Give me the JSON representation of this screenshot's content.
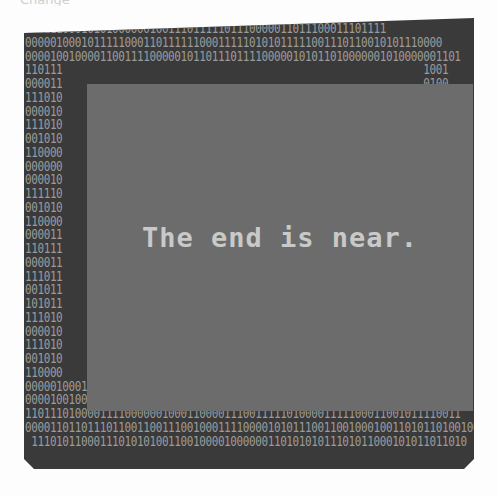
{
  "image": {
    "caption_fragment": "Change",
    "headline": "The end is near.",
    "colors": {
      "frame": "#3a3a3a",
      "panel": "#6c6c6c",
      "binary_text": "#9a9a9a",
      "headline_text": "#c9c9c9",
      "background": "#fdfdfd"
    },
    "binary_rows": [
      "1111110001010100000010011101111101110000011011100011101111",
      "0000010001011111000110111111000111110101011111001110110010101110000",
      "0000100100001100111100000101101110111100000101011010000001010000001101",
      "110111                                                          1001",
      "000011                                                          0100",
      "111010                                                          1010",
      "000010                                                          0110",
      "111010                                                          1011",
      "001010                                                          0010",
      "110000                                                          0111",
      "000000                                                          0001",
      "000010                                                          0011",
      "111110                                                          1011",
      "001010                                                          0010",
      "110000                                                          0111",
      "000011                                                          1111",
      "110111                                                          1001",
      "000011                                                          1100",
      "111011                                                          1111",
      "001011                                                          0001",
      "101011                                                          1110",
      "111010                                                          1010",
      "000010                                                          0110",
      "111010                                                          1011",
      "001010                                                          0010",
      "110000                                                          0111",
      "0000010001011111000110111111000111101010111110011101100101011100001",
      "0000100100001100111100000101101110111100000101011010000001010000001101",
      "1101110100001111000000100011000011100111110100001111100011001011110011",
      "0000110110111011001100111001000111100001010111001100100010011010110100100",
      " 1110101100011101010100110010000100000011010101011101011000101011011010"
    ]
  }
}
